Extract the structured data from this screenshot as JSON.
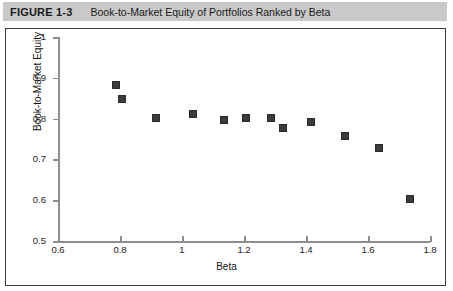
{
  "figure": {
    "number": "FIGURE 1-3",
    "title": "Book-to-Market Equity of Portfolios Ranked by Beta"
  },
  "chart_data": {
    "type": "scatter",
    "title": "Book-to-Market Equity of Portfolios Ranked by Beta",
    "xlabel": "Beta",
    "ylabel": "Book-to-Market Equity",
    "xlim": [
      0.6,
      1.8
    ],
    "ylim": [
      0.5,
      1.0
    ],
    "xticks": [
      0.6,
      0.8,
      1.0,
      1.2,
      1.4,
      1.6,
      1.8
    ],
    "xtick_labels": [
      "0.6",
      "0.8",
      "1",
      "1.2",
      "1.4",
      "1.6",
      "1.8"
    ],
    "yticks": [
      0.5,
      0.6,
      0.7,
      0.8,
      0.9,
      1.0
    ],
    "ytick_labels": [
      "0.5",
      "0.6",
      "0.7",
      "0.8",
      "0.9",
      "1"
    ],
    "grid": false,
    "legend": null,
    "marker": {
      "shape": "square",
      "color": "#3b3b3b",
      "size": 8
    },
    "x": [
      0.79,
      0.81,
      0.92,
      1.04,
      1.14,
      1.21,
      1.29,
      1.33,
      1.42,
      1.53,
      1.64,
      1.74
    ],
    "y": [
      0.88,
      0.845,
      0.8,
      0.81,
      0.795,
      0.8,
      0.8,
      0.775,
      0.79,
      0.755,
      0.725,
      0.6
    ],
    "points": [
      {
        "x": 0.79,
        "y": 0.88
      },
      {
        "x": 0.81,
        "y": 0.845
      },
      {
        "x": 0.92,
        "y": 0.8
      },
      {
        "x": 1.04,
        "y": 0.81
      },
      {
        "x": 1.14,
        "y": 0.795
      },
      {
        "x": 1.21,
        "y": 0.8
      },
      {
        "x": 1.29,
        "y": 0.8
      },
      {
        "x": 1.33,
        "y": 0.775
      },
      {
        "x": 1.42,
        "y": 0.79
      },
      {
        "x": 1.53,
        "y": 0.755
      },
      {
        "x": 1.64,
        "y": 0.725
      },
      {
        "x": 1.74,
        "y": 0.6
      }
    ]
  }
}
